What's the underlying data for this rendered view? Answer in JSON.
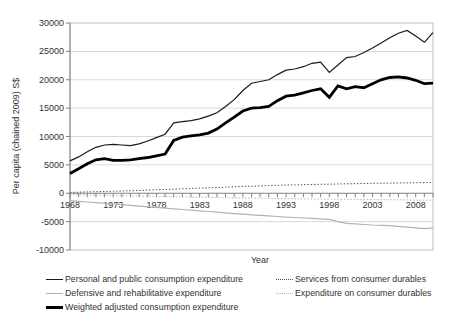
{
  "chart_data": {
    "type": "line",
    "title": "",
    "xlabel": "Year",
    "ylabel": "Per capita (chained 2009) S$",
    "ylim": [
      -10000,
      30000
    ],
    "xlim": [
      1968,
      2010
    ],
    "yticks": [
      30000,
      25000,
      20000,
      15000,
      10000,
      5000,
      0,
      -5000,
      -10000
    ],
    "xticks": [
      1968,
      1973,
      1978,
      1983,
      1988,
      1993,
      1998,
      2003,
      2008
    ],
    "grid": "horizontal",
    "legend_position": "bottom",
    "x": [
      1968,
      1969,
      1970,
      1971,
      1972,
      1973,
      1974,
      1975,
      1976,
      1977,
      1978,
      1979,
      1980,
      1981,
      1982,
      1983,
      1984,
      1985,
      1986,
      1987,
      1988,
      1989,
      1990,
      1991,
      1992,
      1993,
      1994,
      1995,
      1996,
      1997,
      1998,
      1999,
      2000,
      2001,
      2002,
      2003,
      2004,
      2005,
      2006,
      2007,
      2008,
      2009,
      2010
    ],
    "series": [
      {
        "name": "Personal and public consumption expenditure",
        "line": "solid-thin",
        "color": "#1a1a1a",
        "values": [
          5700,
          6400,
          7300,
          8100,
          8500,
          8600,
          8500,
          8400,
          8700,
          9200,
          9800,
          10400,
          12400,
          12600,
          12800,
          13100,
          13600,
          14200,
          15300,
          16500,
          18100,
          19400,
          19700,
          20000,
          20900,
          21700,
          21900,
          22300,
          22900,
          23100,
          21300,
          22600,
          23900,
          24100,
          24800,
          25600,
          26500,
          27400,
          28200,
          28700,
          27700,
          26600,
          28300
        ]
      },
      {
        "name": "Defensive and rehabilitative expenditure",
        "line": "solid-thin",
        "color": "#b3b3b3",
        "values": [
          -1300,
          -1420,
          -1540,
          -1660,
          -1780,
          -1900,
          -2020,
          -2140,
          -2260,
          -2380,
          -2500,
          -2620,
          -2740,
          -2860,
          -2980,
          -3100,
          -3220,
          -3340,
          -3460,
          -3580,
          -3700,
          -3800,
          -3900,
          -4000,
          -4100,
          -4200,
          -4280,
          -4360,
          -4440,
          -4520,
          -4600,
          -5000,
          -5300,
          -5400,
          -5500,
          -5600,
          -5650,
          -5700,
          -5850,
          -5980,
          -6100,
          -6250,
          -6100
        ]
      },
      {
        "name": "Weighted adjusted consumption expenditure",
        "line": "solid-thick",
        "color": "#000000",
        "values": [
          3500,
          4300,
          5200,
          5900,
          6100,
          5800,
          5800,
          5900,
          6100,
          6300,
          6600,
          6900,
          9300,
          9900,
          10100,
          10300,
          10600,
          11300,
          12400,
          13400,
          14500,
          15000,
          15100,
          15300,
          16300,
          17100,
          17300,
          17700,
          18100,
          18400,
          16900,
          18900,
          18400,
          18800,
          18600,
          19300,
          20000,
          20400,
          20500,
          20300,
          19900,
          19300,
          19400
        ]
      },
      {
        "name": "Services from consumer durables",
        "line": "dotted",
        "color": "#4d4d4d",
        "values": [
          150,
          190,
          230,
          270,
          310,
          350,
          400,
          450,
          500,
          550,
          600,
          660,
          720,
          780,
          840,
          900,
          960,
          1020,
          1080,
          1140,
          1200,
          1250,
          1300,
          1350,
          1400,
          1450,
          1480,
          1510,
          1540,
          1570,
          1600,
          1630,
          1660,
          1690,
          1720,
          1750,
          1770,
          1790,
          1810,
          1830,
          1850,
          1880,
          1900
        ]
      },
      {
        "name": "Expenditure on consumer durables",
        "line": "dotted",
        "color": "#b3b3b3",
        "values": [
          -250,
          -280,
          -310,
          -340,
          -370,
          -400,
          -430,
          -460,
          -490,
          -520,
          -550,
          -580,
          -610,
          -640,
          -670,
          -700,
          -730,
          -760,
          -790,
          -820,
          -850,
          -870,
          -890,
          -910,
          -930,
          -950,
          -970,
          -990,
          -1010,
          -1030,
          -1050,
          -1060,
          -1070,
          -1080,
          -1090,
          -1100,
          -1120,
          -1140,
          -1160,
          -1180,
          -1200,
          -1230,
          -1250
        ]
      }
    ],
    "colors": {
      "grid": "#d9d9d9",
      "axis": "#808080",
      "border": "#c0c0c0",
      "text": "#333333"
    }
  },
  "legend": {
    "column1": [
      "Personal and public consumption expenditure",
      "Defensive and rehabilitative expenditure",
      "Weighted adjusted consumption expenditure"
    ],
    "column2": [
      "Services from consumer durables",
      "Expenditure on consumer durables"
    ]
  }
}
